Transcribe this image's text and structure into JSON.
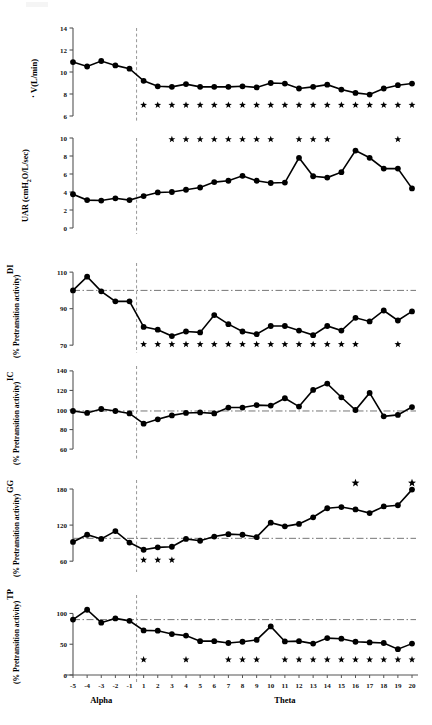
{
  "figure": {
    "x_axis": {
      "alpha_label": "Alpha",
      "theta_label": "Theta",
      "tick_labels": [
        "-5",
        "-4",
        "-3",
        "-2",
        "-1",
        "1",
        "2",
        "3",
        "4",
        "5",
        "6",
        "7",
        "8",
        "9",
        "10",
        "11",
        "12",
        "13",
        "14",
        "15",
        "16",
        "17",
        "18",
        "19",
        "20"
      ]
    },
    "marker_color": "#000000",
    "line_color": "#000000",
    "significance_marker": "*"
  },
  "chart_data": [
    {
      "type": "line",
      "panel": "a",
      "ylabel_main": "V(L/min)",
      "ylabel_sub": "",
      "x": [
        -5,
        -4,
        -3,
        -2,
        -1,
        1,
        2,
        3,
        4,
        5,
        6,
        7,
        8,
        9,
        10,
        11,
        12,
        13,
        14,
        15,
        16,
        17,
        18,
        19,
        20
      ],
      "values": [
        10.9,
        10.5,
        11.0,
        10.6,
        10.3,
        9.2,
        8.7,
        8.65,
        8.9,
        8.65,
        8.65,
        8.65,
        8.7,
        8.6,
        9.0,
        8.95,
        8.5,
        8.65,
        8.85,
        8.4,
        8.1,
        7.95,
        8.5,
        8.8,
        8.95
      ],
      "ylim": [
        6,
        14
      ],
      "yticks": [
        6,
        8,
        10,
        12,
        14
      ],
      "ytick_labels": [
        "6",
        "8",
        "10",
        "12",
        "14"
      ],
      "transition_line": 0.5,
      "reference_line": null,
      "star_x": [
        1,
        2,
        3,
        4,
        5,
        6,
        7,
        8,
        9,
        10,
        11,
        12,
        13,
        14,
        15,
        16,
        17,
        18,
        19,
        20
      ],
      "star_y": 7.0
    },
    {
      "type": "line",
      "panel": "b",
      "ylabel_main": "UAR (cmH O/L/sec)",
      "ylabel_sub": "2",
      "x": [
        -5,
        -4,
        -3,
        -2,
        -1,
        1,
        2,
        3,
        4,
        5,
        6,
        7,
        8,
        9,
        10,
        11,
        12,
        13,
        14,
        15,
        16,
        17,
        18,
        19,
        20
      ],
      "values": [
        3.75,
        3.1,
        3.05,
        3.3,
        3.1,
        3.55,
        3.95,
        4.0,
        4.25,
        4.5,
        5.1,
        5.25,
        5.8,
        5.25,
        5.0,
        5.05,
        7.8,
        5.75,
        5.6,
        6.2,
        8.6,
        7.8,
        6.6,
        6.6,
        4.4
      ],
      "ylim": [
        0,
        10
      ],
      "yticks": [
        0,
        2,
        4,
        6,
        8,
        10
      ],
      "ytick_labels": [
        "0",
        "2",
        "4",
        "6",
        "8",
        "10"
      ],
      "transition_line": 0.5,
      "reference_line": null,
      "star_x": [
        3,
        4,
        5,
        6,
        7,
        8,
        9,
        10,
        12,
        13,
        14,
        19
      ],
      "star_y": 9.85
    },
    {
      "type": "line",
      "panel": "c",
      "ylabel_main": "DI",
      "ylabel_sub": "(% Pretransition activity)",
      "x": [
        -5,
        -4,
        -3,
        -2,
        -1,
        1,
        2,
        3,
        4,
        5,
        6,
        7,
        8,
        9,
        10,
        11,
        12,
        13,
        14,
        15,
        16,
        17,
        18,
        19,
        20
      ],
      "values": [
        100.0,
        107.5,
        99.5,
        94.0,
        94.0,
        80.0,
        78.5,
        75.0,
        77.5,
        77.0,
        86.5,
        81.5,
        77.5,
        76.0,
        80.5,
        80.5,
        78.0,
        75.5,
        80.5,
        78.0,
        85.0,
        83.0,
        89.0,
        83.5,
        88.5
      ],
      "ylim": [
        69,
        115
      ],
      "yticks": [
        70,
        90,
        110
      ],
      "ytick_labels": [
        "70",
        "90",
        "110"
      ],
      "transition_line": 0.5,
      "reference_line": 100,
      "star_x": [
        1,
        2,
        3,
        4,
        5,
        6,
        7,
        8,
        9,
        10,
        11,
        12,
        13,
        14,
        15,
        16,
        19
      ],
      "star_y": 70.5
    },
    {
      "type": "line",
      "panel": "d",
      "ylabel_main": "IC",
      "ylabel_sub": "(% Pretransition activity)",
      "x": [
        -5,
        -4,
        -3,
        -2,
        -1,
        1,
        2,
        3,
        4,
        5,
        6,
        7,
        8,
        9,
        10,
        11,
        12,
        13,
        14,
        15,
        16,
        17,
        18,
        19,
        20
      ],
      "values": [
        99.0,
        97.0,
        101.0,
        99.0,
        96.5,
        86.0,
        90.5,
        94.5,
        97.0,
        97.5,
        96.5,
        102.5,
        102.5,
        105.0,
        104.5,
        112.0,
        103.5,
        120.5,
        127.0,
        113.0,
        100.0,
        117.5,
        93.5,
        95.0,
        103.0
      ],
      "ylim": [
        55,
        145
      ],
      "yticks": [
        60,
        80,
        100,
        120,
        140
      ],
      "ytick_labels": [
        "60",
        "80",
        "100",
        "120",
        "140"
      ],
      "transition_line": 0.5,
      "reference_line": 99,
      "star_x": [],
      "star_y": null
    },
    {
      "type": "line",
      "panel": "e",
      "ylabel_main": "GG",
      "ylabel_sub": "(% Pretransition activity)",
      "x": [
        -5,
        -4,
        -3,
        -2,
        -1,
        1,
        2,
        3,
        4,
        5,
        6,
        7,
        8,
        9,
        10,
        11,
        12,
        13,
        14,
        15,
        16,
        17,
        18,
        19,
        20
      ],
      "values": [
        92.0,
        104.0,
        97.0,
        110.0,
        91.0,
        79.0,
        83.0,
        84.0,
        97.0,
        94.0,
        101.0,
        105.0,
        104.0,
        100.0,
        124.0,
        118.0,
        122.0,
        133.0,
        148.0,
        150.0,
        146.0,
        140.0,
        151.0,
        153.0,
        179.0
      ],
      "ylim": [
        52,
        195
      ],
      "yticks": [
        60,
        120,
        180
      ],
      "ytick_labels": [
        "60",
        "120",
        "180"
      ],
      "transition_line": 0.5,
      "reference_line": 98,
      "star_x": [
        1,
        2,
        3
      ],
      "star_y": 62,
      "star_high_x": [
        16,
        20
      ],
      "star_high_y": 190
    },
    {
      "type": "line",
      "panel": "f",
      "ylabel_main": "TP",
      "ylabel_sub": "(% Pretransition activity)",
      "x": [
        -5,
        -4,
        -3,
        -2,
        -1,
        1,
        2,
        3,
        4,
        5,
        6,
        7,
        8,
        9,
        10,
        11,
        12,
        13,
        14,
        15,
        16,
        17,
        18,
        19,
        20
      ],
      "values": [
        90.0,
        106.0,
        85.0,
        92.0,
        88.0,
        72.5,
        72.0,
        66.5,
        64.0,
        55.0,
        55.0,
        52.0,
        54.0,
        57.0,
        79.0,
        54.5,
        55.0,
        51.0,
        60.0,
        59.0,
        54.0,
        53.0,
        52.0,
        42.0,
        51.0
      ],
      "ylim": [
        0,
        130
      ],
      "yticks": [
        0,
        50,
        100
      ],
      "ytick_labels": [
        "0",
        "50",
        "100"
      ],
      "transition_line": 0.5,
      "reference_line": 90,
      "star_x": [
        1,
        4,
        7,
        8,
        9,
        11,
        12,
        13,
        14,
        15,
        16,
        17,
        18,
        19,
        20
      ],
      "star_y": 25
    }
  ]
}
